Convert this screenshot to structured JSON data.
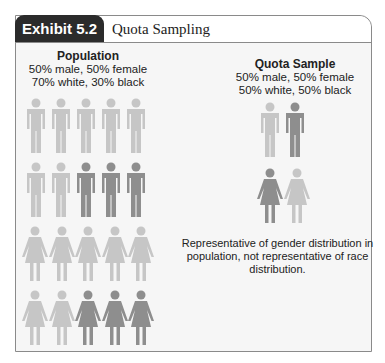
{
  "exhibit": {
    "tag": "Exhibit 5.2",
    "title": "Quota Sampling"
  },
  "population": {
    "heading": "Population",
    "line1": "50% male, 50% female",
    "line2": "70% white, 30% black",
    "rows": [
      {
        "gender": "male",
        "figures": [
          "white",
          "white",
          "white",
          "white",
          "white"
        ]
      },
      {
        "gender": "male",
        "figures": [
          "white",
          "white",
          "black",
          "black",
          "black"
        ]
      },
      {
        "gender": "female",
        "figures": [
          "white",
          "white",
          "white",
          "white",
          "white"
        ]
      },
      {
        "gender": "female",
        "figures": [
          "white",
          "white",
          "black",
          "black",
          "black"
        ]
      }
    ]
  },
  "quota_sample": {
    "heading": "Quota Sample",
    "line1": "50% male, 50% female",
    "line2": "50% white, 50% black",
    "rows": [
      {
        "gender": "male",
        "figures": [
          "white",
          "black"
        ]
      },
      {
        "gender": "female",
        "figures": [
          "black",
          "white"
        ]
      }
    ]
  },
  "note": "Representative of gender distribution in population, not representative of race distribution.",
  "colors": {
    "white_figure": "#c6c6c6",
    "black_figure": "#8e8e8e",
    "tag_bg": "#2b2b2b",
    "panel_bg": "#f6f6f6"
  }
}
